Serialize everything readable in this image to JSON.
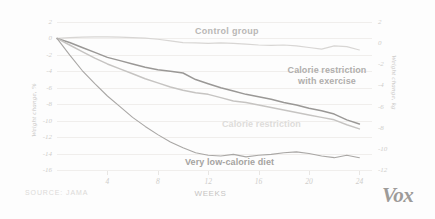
{
  "chart_data": {
    "type": "line",
    "title": "",
    "subtitle": "",
    "xlabel": "WEEKS",
    "ylabel": "Weight change, %",
    "ylabel_right": "Weight change, kg",
    "xlim": [
      0,
      25
    ],
    "ylim": [
      -16,
      2
    ],
    "ylim_right": [
      -12,
      2
    ],
    "grid": true,
    "legend": "inline-labels",
    "xticks": [
      "4",
      "8",
      "12",
      "16",
      "20",
      "24"
    ],
    "xtick_values": [
      4,
      8,
      12,
      16,
      20,
      24
    ],
    "yticks": [
      "2",
      "0",
      "-2",
      "-4",
      "-6",
      "-8",
      "-10",
      "-12",
      "-14",
      "-16"
    ],
    "ytick_values": [
      2,
      0,
      -2,
      -4,
      -6,
      -8,
      -10,
      -12,
      -14,
      -16
    ],
    "yticks_right": [
      "2",
      "0",
      "-2",
      "-4",
      "-6",
      "-8",
      "-10",
      "-12"
    ],
    "ytick_values_right": [
      2,
      0,
      -2,
      -4,
      -6,
      -8,
      -10,
      -12
    ],
    "x": [
      0,
      1,
      2,
      3,
      4,
      5,
      6,
      7,
      8,
      9,
      10,
      11,
      12,
      13,
      14,
      15,
      16,
      17,
      18,
      19,
      20,
      21,
      22,
      23,
      24
    ],
    "series": [
      {
        "name": "Control group",
        "color": "#d8d6d4",
        "values": [
          0,
          0.1,
          0.15,
          0.2,
          0.2,
          0.15,
          0.1,
          0.05,
          -0.1,
          -0.3,
          -0.5,
          -0.55,
          -0.6,
          -0.55,
          -0.6,
          -0.7,
          -0.8,
          -0.85,
          -0.8,
          -0.9,
          -1.1,
          -1.3,
          -0.9,
          -1.0,
          -1.4
        ]
      },
      {
        "name": "Calorie restriction with exercise",
        "color": "#9a9896",
        "values": [
          0,
          -0.5,
          -1.1,
          -1.7,
          -2.3,
          -2.7,
          -3.1,
          -3.5,
          -3.8,
          -4.0,
          -4.2,
          -5.0,
          -5.5,
          -6.0,
          -6.4,
          -6.8,
          -7.1,
          -7.4,
          -7.8,
          -8.1,
          -8.5,
          -8.8,
          -9.2,
          -9.9,
          -10.4
        ]
      },
      {
        "name": "Calorie restriction",
        "color": "#c6c4c2",
        "values": [
          0,
          -0.8,
          -1.6,
          -2.4,
          -3.1,
          -3.7,
          -4.3,
          -4.9,
          -5.4,
          -5.9,
          -6.3,
          -6.6,
          -6.8,
          -7.2,
          -7.6,
          -7.8,
          -8.1,
          -8.4,
          -8.7,
          -9.0,
          -9.3,
          -9.6,
          -9.9,
          -10.5,
          -11.0
        ]
      },
      {
        "name": "Very low-calorie diet",
        "color": "#a9a7a5",
        "values": [
          0,
          -2.0,
          -3.9,
          -5.5,
          -7.0,
          -8.3,
          -9.6,
          -10.7,
          -11.7,
          -12.6,
          -13.3,
          -13.9,
          -14.2,
          -14.3,
          -14.1,
          -14.4,
          -14.2,
          -14.1,
          -13.9,
          -13.8,
          -14.0,
          -14.3,
          -14.5,
          -14.2,
          -14.5
        ]
      }
    ]
  },
  "axes": {
    "left_title": "Weight change, %",
    "right_title": "Weight change, kg",
    "x_title": "WEEKS"
  },
  "labels": {
    "control": "Control group",
    "calorie_restriction_exercise_line1": "Calorie restriction",
    "calorie_restriction_exercise_line2": "with exercise",
    "calorie_restriction": "Calorie restriction",
    "very_low_calorie": "Very low-calorie diet"
  },
  "footer": {
    "source": "SOURCE: JAMA",
    "brand": "Vox"
  },
  "colors": {
    "background": "#fdfdfd",
    "grid": "#f0eeec",
    "tick_text": "#cfcdcb",
    "control": "#d8d6d4",
    "cr_exercise": "#9a9896",
    "cr": "#c6c4c2",
    "vlcd": "#a9a7a5"
  }
}
